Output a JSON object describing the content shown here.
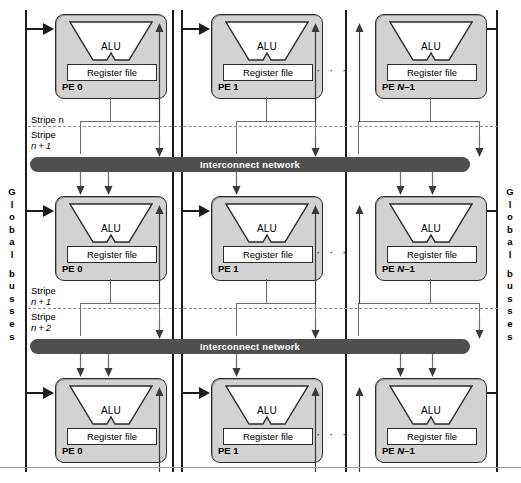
{
  "figure": {
    "colors": {
      "pe_fill": "#d2d2d2",
      "pe_border": "#2b2b2b",
      "interconnect_fill": "#4f4f4f",
      "interconnect_text": "#ffffff",
      "wire": "#6b6b6b",
      "bus_rail": "#1c1c1c",
      "stripe_dash": "#8a8a8a",
      "background": "#ffffff"
    }
  },
  "labels": {
    "alu": "ALU",
    "register_file": "Register file",
    "interconnect": "Interconnect network",
    "ellipsis": "· · ·"
  },
  "pe_names": {
    "pe0": "PE 0",
    "pe1": "PE 1",
    "peN": "PE N–1"
  },
  "rows": [
    {
      "id": "row-0",
      "pes": [
        "PE 0",
        "PE 1",
        "PE N–1"
      ],
      "interconnect": "Interconnect network"
    },
    {
      "id": "row-1",
      "pes": [
        "PE 0",
        "PE 1",
        "PE N–1"
      ],
      "interconnect": "Interconnect network"
    },
    {
      "id": "row-2",
      "pes": [
        "PE 0",
        "PE 1",
        "PE N–1"
      ],
      "interconnect": null
    }
  ],
  "stripes": [
    {
      "id": "stripe-n",
      "above": "Stripe n",
      "below": "Stripe\nn + 1"
    },
    {
      "id": "stripe-n1",
      "above": "Stripe\nn + 1",
      "below": "Stripe\nn + 2"
    }
  ],
  "stripe_text": {
    "s_n_line1": "Stripe n",
    "s_n1_line1": "Stripe",
    "s_n1_line2": "n + 1",
    "s_n1b_line1": "Stripe",
    "s_n1b_line2": "n + 1",
    "s_n2_line1": "Stripe",
    "s_n2_line2": "n + 2"
  },
  "global_busses": {
    "text": "Global busses",
    "letters": [
      "G",
      "l",
      "o",
      "b",
      "a",
      "l",
      "",
      "b",
      "u",
      "s",
      "s",
      "e",
      "s"
    ],
    "left_label": "Global busses",
    "right_label": "Global busses"
  }
}
